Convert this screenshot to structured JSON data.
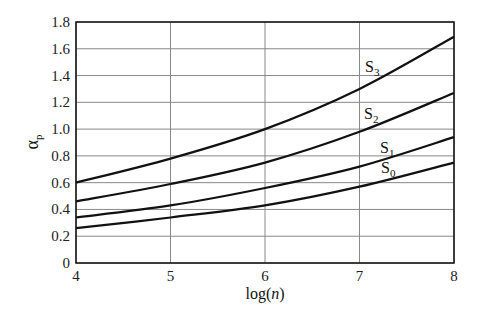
{
  "chart_data": {
    "type": "line",
    "title": "",
    "xlabel": "log(n)",
    "ylabel": "α_p",
    "xlim": [
      4,
      8
    ],
    "ylim": [
      0,
      1.8
    ],
    "grid": true,
    "x_ticks": [
      "4",
      "5",
      "6",
      "7",
      "8"
    ],
    "y_ticks": [
      "0",
      "0.2",
      "0.4",
      "0.6",
      "0.8",
      "1.0",
      "1.2",
      "1.4",
      "1.6",
      "1.8"
    ],
    "x": [
      4,
      5,
      6,
      7,
      8
    ],
    "series": [
      {
        "name": "S3",
        "label_main": "S",
        "label_sub": "3",
        "values": [
          0.6,
          0.78,
          1.0,
          1.3,
          1.69
        ]
      },
      {
        "name": "S2",
        "label_main": "S",
        "label_sub": "2",
        "values": [
          0.46,
          0.59,
          0.75,
          0.98,
          1.27
        ]
      },
      {
        "name": "S1",
        "label_main": "S",
        "label_sub": "1",
        "values": [
          0.34,
          0.43,
          0.56,
          0.72,
          0.94
        ]
      },
      {
        "name": "S0",
        "label_main": "S",
        "label_sub": "0",
        "values": [
          0.26,
          0.34,
          0.43,
          0.57,
          0.75
        ]
      }
    ],
    "annotations": [
      {
        "text": "S3",
        "x": 7.15,
        "y": 1.45
      },
      {
        "text": "S2",
        "x": 7.15,
        "y": 1.1
      },
      {
        "text": "S1",
        "x": 7.3,
        "y": 0.83
      },
      {
        "text": "S0",
        "x": 7.3,
        "y": 0.68
      }
    ],
    "legend_position": "inline labels",
    "colors": {
      "curve": "#111111",
      "grid": "#888888",
      "axis": "#111111"
    }
  }
}
